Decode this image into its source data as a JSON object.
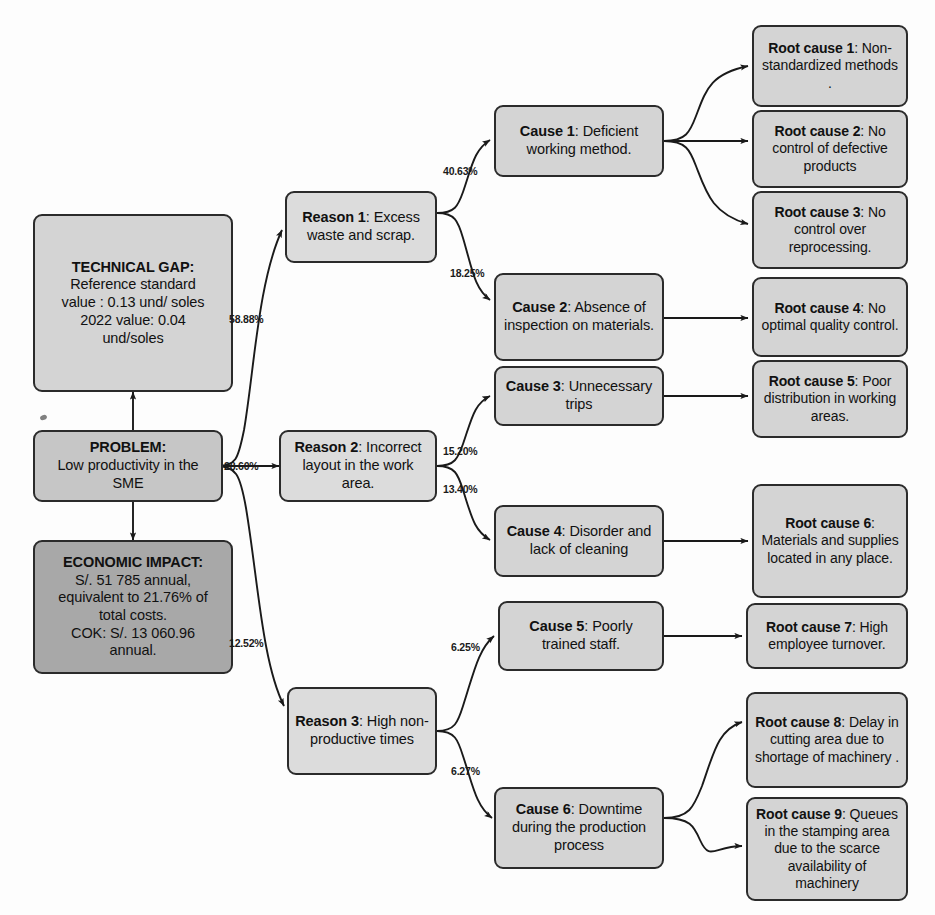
{
  "diagram": {
    "colors": {
      "node_border": "#2b2b2b",
      "node_fill_light": "#d4d4d4",
      "node_fill_mid": "#c6c6c6",
      "node_fill_dark": "#a8a8a8",
      "edge": "#1a1a1a",
      "background": "#fdfdfd"
    }
  },
  "context": {
    "technical_gap": {
      "heading": "TECHNICAL GAP:",
      "line1": "Reference standard",
      "line2": "value : 0.13 und/ soles",
      "line3": "2022 value: 0.04",
      "line4": "und/soles"
    },
    "problem": {
      "heading": "PROBLEM:",
      "line1": "Low productivity in the",
      "line2": "SME"
    },
    "economic_impact": {
      "heading": "ECONOMIC IMPACT:",
      "line1": "S/. 51 785 annual,",
      "line2": "equivalent to 21.76% of",
      "line3": "total costs.",
      "line4": "COK: S/. 13 060.96",
      "line5": "annual."
    }
  },
  "reasons": [
    {
      "id": "reason1",
      "label": "Reason 1",
      "text": "Excess waste and scrap.",
      "weight": "58.88%"
    },
    {
      "id": "reason2",
      "label": "Reason 2",
      "text": "Incorrect layout in the work area.",
      "weight": "28.60%"
    },
    {
      "id": "reason3",
      "label": "Reason 3",
      "text": "High non-productive times",
      "weight": "12.52%"
    }
  ],
  "causes": [
    {
      "id": "cause1",
      "label": "Cause 1",
      "text": "Deficient working method.",
      "weight": "40.63%",
      "parent": "reason1"
    },
    {
      "id": "cause2",
      "label": "Cause 2",
      "text": "Absence of inspection on materials.",
      "weight": "18.25%",
      "parent": "reason1"
    },
    {
      "id": "cause3",
      "label": "Cause 3",
      "text": "Unnecessary trips",
      "weight": "15.20%",
      "parent": "reason2"
    },
    {
      "id": "cause4",
      "label": "Cause 4",
      "text": "Disorder and lack of cleaning",
      "weight": "13.40%",
      "parent": "reason2"
    },
    {
      "id": "cause5",
      "label": "Cause 5",
      "text": "Poorly trained staff.",
      "weight": "6.25%",
      "parent": "reason3"
    },
    {
      "id": "cause6",
      "label": "Cause 6",
      "text": "Downtime during the production process",
      "weight": "6.27%",
      "parent": "reason3"
    }
  ],
  "root_causes": [
    {
      "id": "root1",
      "label": "Root cause 1",
      "text": "Non-standardized methods .",
      "parent": "cause1"
    },
    {
      "id": "root2",
      "label": "Root cause 2",
      "text": "No control of defective products",
      "parent": "cause1"
    },
    {
      "id": "root3",
      "label": "Root cause 3",
      "text": "No control over reprocessing.",
      "parent": "cause1"
    },
    {
      "id": "root4",
      "label": "Root cause 4",
      "text": "No optimal quality control.",
      "parent": "cause2"
    },
    {
      "id": "root5",
      "label": "Root cause 5",
      "text": "Poor distribution in working areas.",
      "parent": "cause3"
    },
    {
      "id": "root6",
      "label": "Root cause 6",
      "text": "Materials and supplies located in any place.",
      "parent": "cause4"
    },
    {
      "id": "root7",
      "label": "Root cause 7",
      "text": "High employee turnover.",
      "parent": "cause5"
    },
    {
      "id": "root8",
      "label": "Root cause 8",
      "text": "Delay in cutting area due to shortage of machinery .",
      "parent": "cause6"
    },
    {
      "id": "root9",
      "label": "Root cause 9",
      "text": "Queues in the stamping area due to the scarce availability of machinery",
      "parent": "cause6"
    }
  ]
}
